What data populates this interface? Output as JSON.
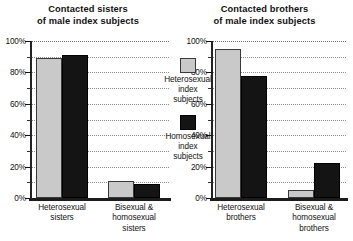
{
  "chart_data": [
    {
      "type": "bar",
      "id": "sisters",
      "title": "Contacted sisters\nof male index subjects",
      "title_line1": "Contacted sisters",
      "title_line2": "of male index subjects",
      "xlabel": "",
      "ylabel": "",
      "ylim": [
        0,
        100
      ],
      "yticks": [
        0,
        20,
        40,
        60,
        80,
        100
      ],
      "ytick_labels": [
        "0%",
        "20%",
        "40%",
        "60%",
        "80%",
        "100%"
      ],
      "minor_yticks": [
        10,
        30,
        50,
        70,
        90
      ],
      "gridlines": [
        10,
        20,
        30,
        40,
        50,
        60,
        70,
        80,
        90,
        100
      ],
      "grid": true,
      "categories": [
        "Heterosexual sisters",
        "Bisexual & homosexual sisters"
      ],
      "category_lines": [
        [
          "Heterosexual",
          "sisters"
        ],
        [
          "Bisexual &",
          "homosexual",
          "sisters"
        ]
      ],
      "series": [
        {
          "name": "Heterosexual index subjects",
          "color": "#c9c9c9",
          "values": [
            89,
            11
          ]
        },
        {
          "name": "Homosexual index subjects",
          "color": "#141414",
          "values": [
            91,
            9
          ]
        }
      ]
    },
    {
      "type": "bar",
      "id": "brothers",
      "title": "Contacted brothers\nof male index subjects",
      "title_line1": "Contacted brothers",
      "title_line2": "of male index subjects",
      "xlabel": "",
      "ylabel": "",
      "ylim": [
        0,
        100
      ],
      "yticks": [
        0,
        20,
        40,
        60,
        80,
        100
      ],
      "ytick_labels": [
        "0%",
        "20%",
        "40%",
        "60%",
        "80%",
        "100%"
      ],
      "minor_yticks": [
        10,
        30,
        50,
        70,
        90
      ],
      "gridlines": [
        10,
        20,
        30,
        40,
        50,
        60,
        70,
        80,
        90,
        100
      ],
      "grid": true,
      "categories": [
        "Heterosexual brothers",
        "Bisexual & homosexual brothers"
      ],
      "category_lines": [
        [
          "Heterosexual",
          "brothers"
        ],
        [
          "Bisexual &",
          "homosexual",
          "brothers"
        ]
      ],
      "series": [
        {
          "name": "Heterosexual index subjects",
          "color": "#c9c9c9",
          "values": [
            95,
            5
          ]
        },
        {
          "name": "Homosexual index subjects",
          "color": "#141414",
          "values": [
            78,
            22
          ]
        }
      ]
    }
  ],
  "legend": {
    "position": "center",
    "entries": [
      {
        "swatch": "light",
        "color": "#c9c9c9",
        "label": "Heterosexual index subjects",
        "line1": "Heterosexual",
        "line2": "index",
        "line3": "subjects"
      },
      {
        "swatch": "dark",
        "color": "#141414",
        "label": "Homosexual index subjects",
        "line1": "Homosexual",
        "line2": "index",
        "line3": "subjects"
      }
    ]
  }
}
